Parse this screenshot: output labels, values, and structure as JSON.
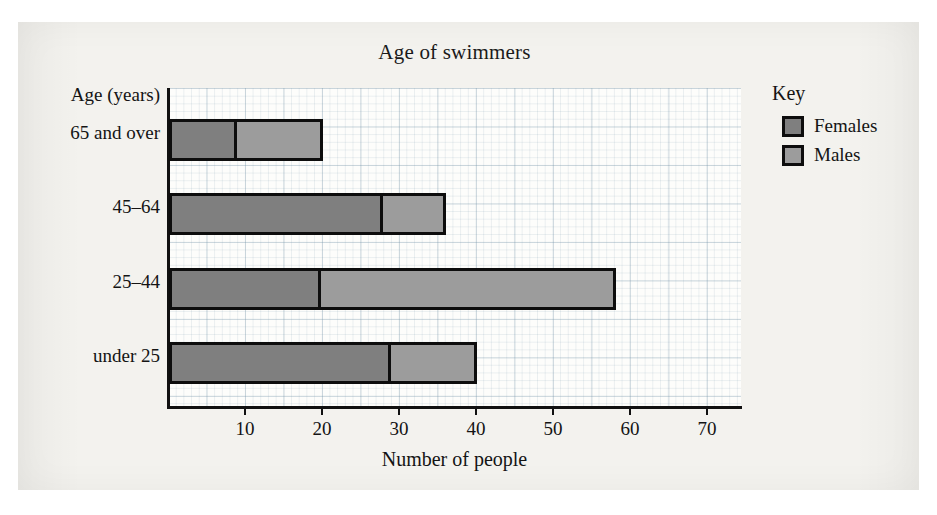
{
  "chart_data": {
    "type": "bar",
    "orientation": "horizontal",
    "stacked": true,
    "title": "Age of swimmers",
    "xlabel": "Number of people",
    "ylabel": "Age (years)",
    "categories": [
      "65 and over",
      "45–64",
      "25–44",
      "under 25"
    ],
    "series": [
      {
        "name": "Females",
        "color": "#7f7f7f",
        "values": [
          8,
          27,
          19,
          28
        ]
      },
      {
        "name": "Males",
        "color": "#9c9c9c",
        "values": [
          12,
          9,
          39,
          12
        ]
      }
    ],
    "totals": [
      20,
      36,
      58,
      40
    ],
    "xlim": [
      0,
      74.5
    ],
    "xticks": [
      10,
      20,
      30,
      40,
      50,
      60,
      70
    ],
    "xtick_labels": [
      "10",
      "20",
      "30",
      "40",
      "50",
      "60",
      "70"
    ],
    "grid": "graph-paper, minor every 1 unit, major every 5 units",
    "legend_position": "right"
  },
  "key": {
    "title": "Key",
    "entries": [
      {
        "label": "Females",
        "swatch": "female-swatch"
      },
      {
        "label": "Males",
        "swatch": "male-swatch"
      }
    ]
  }
}
